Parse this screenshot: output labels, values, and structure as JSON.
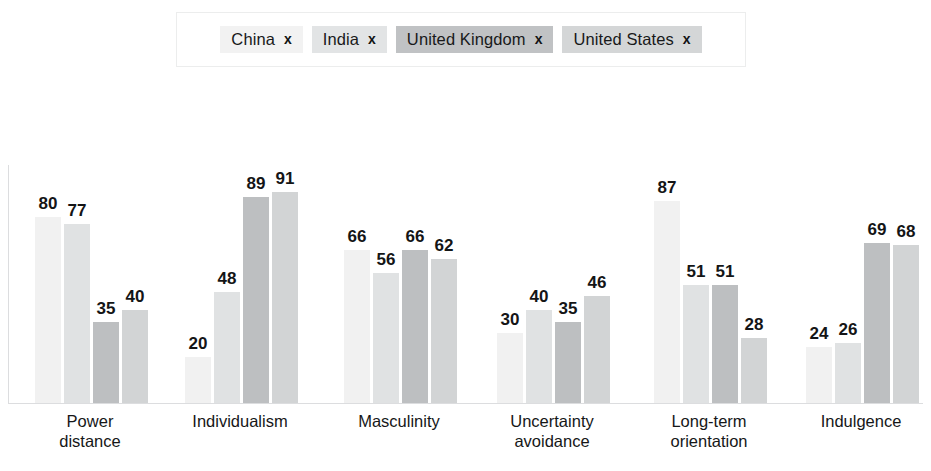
{
  "legend": {
    "items": [
      {
        "label": "China",
        "remove_icon": "x",
        "color": "#f2f2f2"
      },
      {
        "label": "India",
        "remove_icon": "x",
        "color": "#e2e4e5"
      },
      {
        "label": "United Kingdom",
        "remove_icon": "x",
        "color": "#c0c2c4"
      },
      {
        "label": "United States",
        "remove_icon": "x",
        "color": "#d4d6d7"
      }
    ]
  },
  "chart_data": {
    "type": "bar",
    "title": "",
    "xlabel": "",
    "ylabel": "",
    "ylim": [
      0,
      100
    ],
    "grid": false,
    "legend_position": "top",
    "categories": [
      "Power\ndistance",
      "Individualism",
      "Masculinity",
      "Uncertainty\navoidance",
      "Long-term\norientation",
      "Indulgence"
    ],
    "series": [
      {
        "name": "China",
        "color": "#f1f1f1",
        "values": [
          80,
          20,
          66,
          30,
          87,
          24
        ]
      },
      {
        "name": "India",
        "color": "#e0e2e3",
        "values": [
          77,
          48,
          56,
          40,
          51,
          26
        ]
      },
      {
        "name": "United Kingdom",
        "color": "#bdbfc1",
        "values": [
          35,
          89,
          66,
          35,
          51,
          69
        ]
      },
      {
        "name": "United States",
        "color": "#d2d4d5",
        "values": [
          40,
          91,
          62,
          46,
          28,
          68
        ]
      }
    ]
  },
  "layout": {
    "group_left_px": [
      35,
      185,
      344,
      497,
      654,
      806
    ],
    "px_per_unit": 2.32,
    "label_centers_px": [
      90,
      240,
      399,
      552,
      709,
      861
    ]
  }
}
